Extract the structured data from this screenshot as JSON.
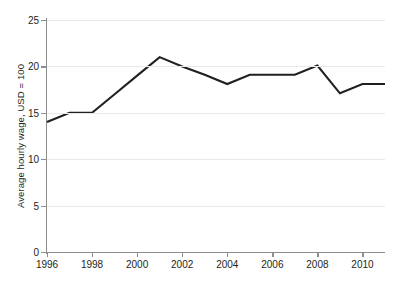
{
  "chart_data": {
    "type": "line",
    "title": "",
    "subtitle": "",
    "xlabel": "",
    "ylabel": "Average hourly wage, USD = 100",
    "x": [
      1996,
      1997,
      1998,
      1999,
      2000,
      2001,
      2002,
      2003,
      2004,
      2005,
      2006,
      2007,
      2008,
      2009,
      2010,
      2011
    ],
    "series": [
      {
        "name": "Average hourly wage",
        "values": [
          14.0,
          15.0,
          15.0,
          17.0,
          19.0,
          21.0,
          20.0,
          19.1,
          18.1,
          19.1,
          19.1,
          19.1,
          20.1,
          17.1,
          18.1,
          18.1
        ]
      }
    ],
    "xlim": [
      1996,
      2011
    ],
    "ylim": [
      0,
      25
    ],
    "ytick_values": [
      0,
      5,
      10,
      15,
      20,
      25
    ],
    "ytick_labels": [
      "0",
      "5",
      "10",
      "15",
      "20",
      "25"
    ],
    "xtick_values": [
      1996,
      1998,
      2000,
      2002,
      2004,
      2006,
      2008,
      2010
    ],
    "xtick_labels": [
      "1996",
      "1998",
      "2000",
      "2002",
      "2004",
      "2006",
      "2008",
      "2010"
    ],
    "grid": "horizontal",
    "legend": "none",
    "colors": {
      "line": "#231f20",
      "grid": "#e9e9e9",
      "axis": "#8d8d8d",
      "text": "#231f20",
      "background": "#ffffff"
    }
  }
}
